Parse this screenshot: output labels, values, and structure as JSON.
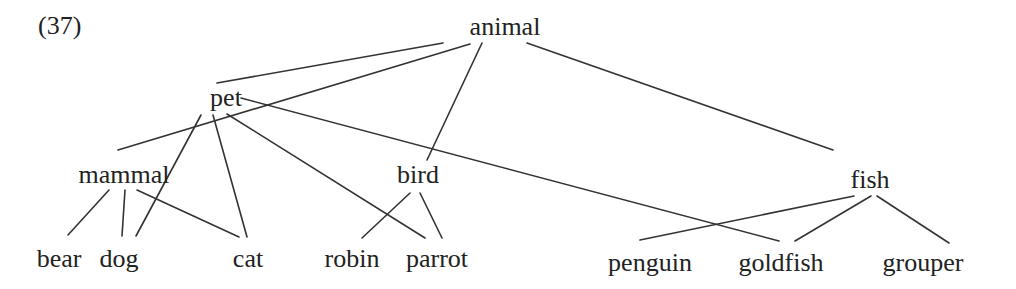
{
  "example_number": "(37)",
  "nodes": {
    "animal": {
      "label": "animal",
      "x": 505,
      "y": 14
    },
    "pet": {
      "label": "pet",
      "x": 226,
      "y": 85
    },
    "mammal": {
      "label": "mammal",
      "x": 124,
      "y": 162
    },
    "bird": {
      "label": "bird",
      "x": 418,
      "y": 162
    },
    "fish": {
      "label": "fish",
      "x": 870,
      "y": 167
    },
    "bear": {
      "label": "bear",
      "x": 59,
      "y": 246
    },
    "dog": {
      "label": "dog",
      "x": 119,
      "y": 246
    },
    "cat": {
      "label": "cat",
      "x": 248,
      "y": 246
    },
    "robin": {
      "label": "robin",
      "x": 352,
      "y": 246
    },
    "parrot": {
      "label": "parrot",
      "x": 437,
      "y": 246
    },
    "penguin": {
      "label": "penguin",
      "x": 650,
      "y": 250
    },
    "goldfish": {
      "label": "goldfish",
      "x": 781,
      "y": 250
    },
    "grouper": {
      "label": "grouper",
      "x": 923,
      "y": 250
    }
  },
  "edges": [
    {
      "from": "animal",
      "to": "pet",
      "x1": 443,
      "y1": 43,
      "x2": 217,
      "y2": 83
    },
    {
      "from": "animal",
      "to": "mammal",
      "x1": 470,
      "y1": 44,
      "x2": 118,
      "y2": 150
    },
    {
      "from": "animal",
      "to": "bird",
      "x1": 482,
      "y1": 43,
      "x2": 427,
      "y2": 160
    },
    {
      "from": "animal",
      "to": "fish",
      "x1": 527,
      "y1": 43,
      "x2": 833,
      "y2": 150
    },
    {
      "from": "pet",
      "to": "dog",
      "x1": 201,
      "y1": 115,
      "x2": 136,
      "y2": 236
    },
    {
      "from": "pet",
      "to": "cat",
      "x1": 213,
      "y1": 115,
      "x2": 247,
      "y2": 237
    },
    {
      "from": "pet",
      "to": "parrot",
      "x1": 227,
      "y1": 114,
      "x2": 425,
      "y2": 238
    },
    {
      "from": "pet",
      "to": "goldfish",
      "x1": 241,
      "y1": 98,
      "x2": 779,
      "y2": 241
    },
    {
      "from": "mammal",
      "to": "bear",
      "x1": 109,
      "y1": 190,
      "x2": 68,
      "y2": 235
    },
    {
      "from": "mammal",
      "to": "dog",
      "x1": 125,
      "y1": 190,
      "x2": 122,
      "y2": 236
    },
    {
      "from": "mammal",
      "to": "cat",
      "x1": 137,
      "y1": 190,
      "x2": 239,
      "y2": 237
    },
    {
      "from": "bird",
      "to": "robin",
      "x1": 410,
      "y1": 193,
      "x2": 362,
      "y2": 238
    },
    {
      "from": "bird",
      "to": "parrot",
      "x1": 420,
      "y1": 193,
      "x2": 442,
      "y2": 238
    },
    {
      "from": "fish",
      "to": "penguin",
      "x1": 854,
      "y1": 196,
      "x2": 640,
      "y2": 240
    },
    {
      "from": "fish",
      "to": "goldfish",
      "x1": 871,
      "y1": 196,
      "x2": 795,
      "y2": 241
    },
    {
      "from": "fish",
      "to": "grouper",
      "x1": 877,
      "y1": 196,
      "x2": 949,
      "y2": 243
    }
  ]
}
